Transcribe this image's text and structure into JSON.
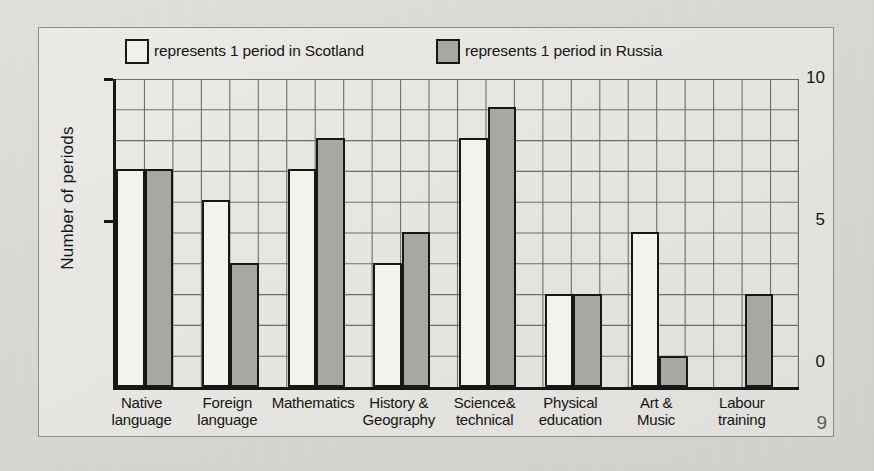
{
  "page": {
    "number": "9"
  },
  "legend": {
    "items": [
      {
        "swatch": "white",
        "label": "represents 1 period in Scotland"
      },
      {
        "swatch": "grey",
        "label": "represents 1 period in Russia"
      }
    ]
  },
  "colors": {
    "scotland_fill": "#f4f2ef",
    "russia_fill": "#a9a7a4",
    "outline": "#171717",
    "grid": "#6e6e6e",
    "paper": "#e4e2de"
  },
  "chart_data": {
    "type": "bar",
    "title": "",
    "xlabel": "",
    "ylabel": "Number of periods",
    "ylim": [
      0,
      10
    ],
    "yticks": [
      "0",
      "5",
      "10"
    ],
    "grid": true,
    "legend_position": "top",
    "categories": [
      "Native language",
      "Foreign language",
      "Mathematics",
      "History & Geography",
      "Science& technical",
      "Physical education",
      "Art & Music",
      "Labour training"
    ],
    "category_label_lines": [
      [
        "Native",
        "language"
      ],
      [
        "Foreign",
        "language"
      ],
      [
        "Mathematics",
        ""
      ],
      [
        "History &",
        "Geography"
      ],
      [
        "Science&",
        "technical"
      ],
      [
        "Physical",
        "education"
      ],
      [
        "Art &",
        "Music"
      ],
      [
        "Labour",
        "training"
      ]
    ],
    "series": [
      {
        "name": "Scotland",
        "values": [
          7,
          6,
          7,
          4,
          8,
          3,
          5,
          0
        ]
      },
      {
        "name": "Russia",
        "values": [
          7,
          4,
          8,
          5,
          9,
          3,
          1,
          3
        ]
      }
    ]
  }
}
